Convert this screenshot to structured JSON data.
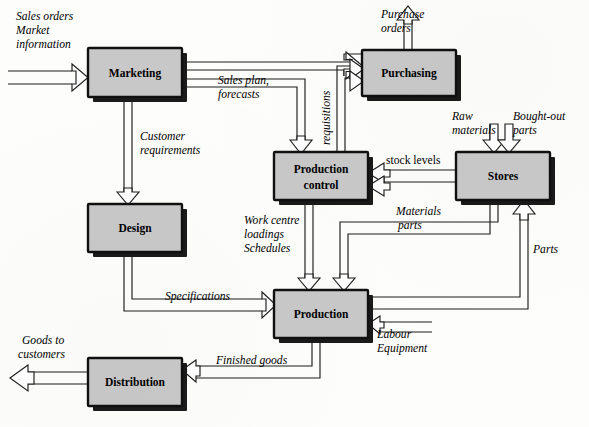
{
  "diagram": {
    "type": "block-flow-diagram",
    "box_fill": "#c8c8c8",
    "box_stroke": "#101010",
    "arrow_stroke": "#1d1d1d",
    "background": "#fdfdfb",
    "nodes": [
      {
        "id": "marketing",
        "label": "Marketing",
        "x": 88,
        "y": 48,
        "w": 94,
        "h": 49
      },
      {
        "id": "purchasing",
        "label": "Purchasing",
        "x": 362,
        "y": 50,
        "w": 94,
        "h": 46
      },
      {
        "id": "production-control",
        "label_line1": "Production",
        "label_line2": "control",
        "x": 274,
        "y": 152,
        "w": 94,
        "h": 48
      },
      {
        "id": "stores",
        "label": "Stores",
        "x": 456,
        "y": 152,
        "w": 94,
        "h": 48
      },
      {
        "id": "design",
        "label": "Design",
        "x": 88,
        "y": 204,
        "w": 94,
        "h": 48
      },
      {
        "id": "production",
        "label": "Production",
        "x": 274,
        "y": 290,
        "w": 94,
        "h": 48
      },
      {
        "id": "distribution",
        "label": "Distribution",
        "x": 88,
        "y": 358,
        "w": 94,
        "h": 48
      }
    ],
    "edge_labels": [
      {
        "id": "sales-orders",
        "lines": [
          "Sales orders",
          "Market",
          "information"
        ],
        "x": 16,
        "y": 14,
        "style": "italic"
      },
      {
        "id": "sales-plan",
        "lines": [
          "Sales plan,",
          "forecasts"
        ],
        "x": 218,
        "y": 76,
        "style": "italic"
      },
      {
        "id": "customer-requirements",
        "lines": [
          "Customer",
          "requirements"
        ],
        "x": 138,
        "y": 132,
        "style": "italic"
      },
      {
        "id": "purchase-orders",
        "lines": [
          "Purchase",
          "orders"
        ],
        "x": 381,
        "y": 10,
        "style": "italic"
      },
      {
        "id": "requisitions",
        "lines": [
          "requisitions"
        ],
        "x": 325,
        "y": 108,
        "style": "italic",
        "rotated": true
      },
      {
        "id": "raw-materials",
        "lines": [
          "Raw",
          "materials"
        ],
        "x": 454,
        "y": 112,
        "style": "italic"
      },
      {
        "id": "bought-out-parts",
        "lines": [
          "Bought-out",
          "parts"
        ],
        "x": 513,
        "y": 112,
        "style": "italic"
      },
      {
        "id": "stock-levels",
        "lines": [
          "stock levels"
        ],
        "x": 386,
        "y": 157,
        "style": "upright"
      },
      {
        "id": "work-centre",
        "lines": [
          "Work centre",
          "loadings",
          "Schedules"
        ],
        "x": 246,
        "y": 215,
        "style": "italic"
      },
      {
        "id": "materials-parts",
        "lines": [
          "Materials",
          "parts"
        ],
        "x": 396,
        "y": 207,
        "style": "italic"
      },
      {
        "id": "parts",
        "lines": [
          "Parts"
        ],
        "x": 530,
        "y": 247,
        "style": "italic"
      },
      {
        "id": "specifications",
        "lines": [
          "Specifications"
        ],
        "x": 165,
        "y": 293,
        "style": "italic"
      },
      {
        "id": "labour-equipment",
        "lines": [
          "Labour",
          "Equipment"
        ],
        "x": 377,
        "y": 329,
        "style": "italic"
      },
      {
        "id": "goods-to-customers",
        "lines": [
          "Goods to",
          "customers"
        ],
        "x": 22,
        "y": 336,
        "style": "italic"
      },
      {
        "id": "finished-goods",
        "lines": [
          "Finished goods"
        ],
        "x": 216,
        "y": 357,
        "style": "italic"
      }
    ],
    "flows": [
      {
        "id": "flow-sales-orders-to-marketing",
        "from": "external",
        "to": "marketing"
      },
      {
        "id": "flow-marketing-to-production-control",
        "from": "marketing",
        "to": "production-control"
      },
      {
        "id": "flow-marketing-to-purchasing",
        "from": "marketing",
        "to": "purchasing"
      },
      {
        "id": "flow-marketing-to-design",
        "from": "marketing",
        "to": "design"
      },
      {
        "id": "flow-purchasing-to-external",
        "from": "purchasing",
        "to": "external"
      },
      {
        "id": "flow-production-control-to-purchasing",
        "from": "production-control",
        "to": "purchasing"
      },
      {
        "id": "flow-raw-materials-to-stores",
        "from": "external",
        "to": "stores"
      },
      {
        "id": "flow-bought-out-parts-to-stores",
        "from": "external",
        "to": "stores"
      },
      {
        "id": "flow-stores-to-production-control",
        "from": "stores",
        "to": "production-control"
      },
      {
        "id": "flow-production-control-to-production",
        "from": "production-control",
        "to": "production"
      },
      {
        "id": "flow-stores-to-production",
        "from": "stores",
        "to": "production"
      },
      {
        "id": "flow-production-to-stores",
        "from": "production",
        "to": "stores"
      },
      {
        "id": "flow-design-to-production",
        "from": "design",
        "to": "production"
      },
      {
        "id": "flow-labour-equipment-to-production",
        "from": "external",
        "to": "production"
      },
      {
        "id": "flow-production-to-distribution",
        "from": "production",
        "to": "distribution"
      },
      {
        "id": "flow-distribution-to-customers",
        "from": "distribution",
        "to": "external"
      }
    ]
  }
}
